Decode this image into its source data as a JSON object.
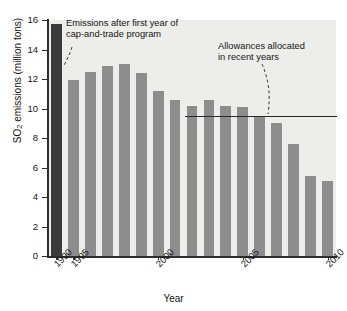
{
  "chart_data": {
    "type": "bar",
    "title": "",
    "xlabel": "Year",
    "ylabel": "SO2 emissions (million tons)",
    "ylabel_parts": {
      "prefix": "SO",
      "sub": "2",
      "suffix": " emissions (million tons)"
    },
    "ylim": [
      0,
      16
    ],
    "ytick_values": [
      0,
      2,
      4,
      6,
      8,
      10,
      12,
      14,
      16
    ],
    "ytick_labels": [
      "0",
      "2",
      "4",
      "6",
      "8",
      "10",
      "12",
      "14",
      "16"
    ],
    "xtick_labels": [
      "1990",
      "1995",
      "2000",
      "2005",
      "2010"
    ],
    "xtick_years": [
      1990,
      1995,
      2000,
      2005,
      2010
    ],
    "grid": false,
    "legend": "none",
    "categories": [
      "1990",
      "1995",
      "1996",
      "1997",
      "1998",
      "1999",
      "2000",
      "2001",
      "2002",
      "2003",
      "2004",
      "2005",
      "2006",
      "2007",
      "2008",
      "2009",
      "2010"
    ],
    "values": [
      15.7,
      11.9,
      12.5,
      12.9,
      13.0,
      12.4,
      11.2,
      10.6,
      10.2,
      10.6,
      10.2,
      10.1,
      9.5,
      9.0,
      7.6,
      5.4,
      5.1
    ],
    "bar_colors": [
      "#3b3b3b",
      "#8d8d8d",
      "#8d8d8d",
      "#8d8d8d",
      "#8d8d8d",
      "#8d8d8d",
      "#8d8d8d",
      "#8d8d8d",
      "#8d8d8d",
      "#8d8d8d",
      "#8d8d8d",
      "#8d8d8d",
      "#8d8d8d",
      "#8d8d8d",
      "#8d8d8d",
      "#8d8d8d",
      "#8d8d8d"
    ],
    "highlight_category": "1990",
    "reference_line": {
      "label": "Allowances allocated in recent years",
      "value": 9.4,
      "start_category": "2002",
      "end_category": "2010",
      "color": "#2a2a2a"
    },
    "annotations": [
      {
        "id": "cap-trade",
        "text": "Emissions after first year of\ncap-and-trade program",
        "points_to_category": "1995"
      },
      {
        "id": "allowances",
        "text": "Allowances allocated\nin recent years",
        "points_to": "reference-line"
      }
    ],
    "colors": {
      "bar": "#8d8d8d",
      "bar_highlight": "#3b3b3b",
      "plot_background": "#ededea",
      "axis": "#2d2d2d",
      "text": "#161616"
    }
  }
}
